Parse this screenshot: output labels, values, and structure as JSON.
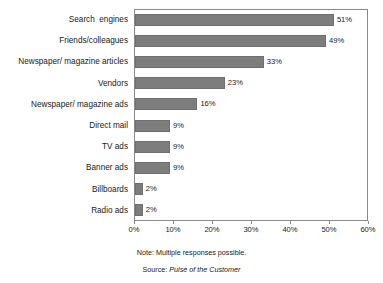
{
  "chart_data": {
    "type": "bar",
    "orientation": "horizontal",
    "title": "",
    "subtitle": "",
    "xlabel": "",
    "ylabel": "",
    "xlim": [
      0,
      60
    ],
    "xtick_step": 10,
    "grid": false,
    "legend": null,
    "bar_color": "#7d7d7d",
    "frame_color": "#8a8a8a",
    "categories": [
      "Search  engines",
      "Friends/colleagues",
      "Newspaper/ magazine articles",
      "Vendors",
      "Newspaper/ magazine ads",
      "Direct mail",
      "TV ads",
      "Banner ads",
      "Billboards",
      "Radio ads"
    ],
    "values": [
      51,
      49,
      33,
      23,
      16,
      9,
      9,
      9,
      2,
      2
    ],
    "data_labels": [
      "51%",
      "49%",
      "33%",
      "23%",
      "16%",
      "9%",
      "9%",
      "9%",
      "2%",
      "2%"
    ],
    "xticks": [
      0,
      10,
      20,
      30,
      40,
      50,
      60
    ],
    "xtick_labels": [
      "0%",
      "10%",
      "20%",
      "30%",
      "40%",
      "50%",
      "60%"
    ]
  },
  "footnotes": {
    "note": "Note: Multiple responses possible.",
    "source_prefix": "Source: ",
    "source_title": "Pulse of the Customer"
  }
}
